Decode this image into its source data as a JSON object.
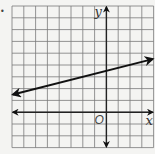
{
  "figure": {
    "type": "coordinate-plane-graph",
    "labels": {
      "x_axis": "x",
      "y_axis": "y",
      "origin": "O"
    },
    "bullet": "•",
    "grid": {
      "left_px": 12,
      "top_px": 6,
      "spacing_px": 11.8,
      "cols": 12,
      "rows": 12,
      "origin_col": 8,
      "origin_row": 9,
      "x_range": [
        -8,
        4
      ],
      "y_range": [
        -3,
        9
      ]
    },
    "line": {
      "description": "straight line with arrows at both ends",
      "slope": 0.25,
      "y_intercept": 3.5,
      "left_point": [
        -8,
        1.5
      ],
      "right_point": [
        4,
        4.5
      ]
    },
    "colors": {
      "background": "#f4f4f2",
      "grid": "#7a7a7a",
      "axis": "#222222",
      "line": "#111111"
    }
  }
}
